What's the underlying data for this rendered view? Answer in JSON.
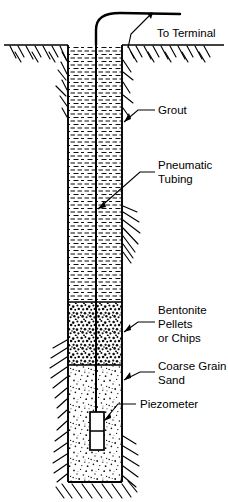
{
  "figure": {
    "background_color": "#ffffff",
    "line_color": "#000000"
  },
  "labels": {
    "to_terminal": "To Terminal",
    "grout": "Grout",
    "pneumatic": "Pneumatic",
    "tubing": "Tubing",
    "bentonite": "Bentonite",
    "pellets": "Pellets",
    "or_chips": "or Chips",
    "coarse_grain": "Coarse Grain",
    "sand": "Sand",
    "piezometer": "Piezometer"
  },
  "geometry": {
    "borehole_left_x": 68,
    "borehole_right_x": 122,
    "tubing_x": 96,
    "ground_surface_y": 45,
    "borehole_bottom_y": 482,
    "grout_top_y": 45,
    "grout_bottom_y": 302,
    "bentonite_top_y": 302,
    "bentonite_bottom_y": 365,
    "sand_top_y": 365,
    "sand_bottom_y": 482,
    "piezometer_x": 90,
    "piezometer_y": 412,
    "piezometer_width": 14,
    "piezometer_height": 38
  },
  "layers": [
    {
      "name": "grout",
      "label": "Grout",
      "fill_pattern": "horizontal-dash-hatch"
    },
    {
      "name": "bentonite-pellets",
      "label": "Bentonite Pellets or Chips",
      "fill_pattern": "dense-stipple"
    },
    {
      "name": "coarse-grain-sand",
      "label": "Coarse Grain Sand",
      "fill_pattern": "sparse-stipple"
    }
  ],
  "components": [
    {
      "name": "pneumatic-tubing",
      "label": "Pneumatic Tubing"
    },
    {
      "name": "piezometer",
      "label": "Piezometer"
    },
    {
      "name": "terminal-lead",
      "label": "To Terminal"
    }
  ]
}
